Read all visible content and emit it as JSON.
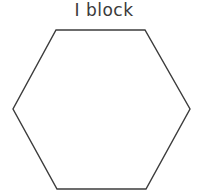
{
  "diagram": {
    "title": "I block",
    "shape": {
      "type": "hexagon",
      "stroke": "#3c3c3c",
      "fill": "#ffffff",
      "points": "56,30 145,30 190,109 146,189 57,189 13,109"
    }
  }
}
